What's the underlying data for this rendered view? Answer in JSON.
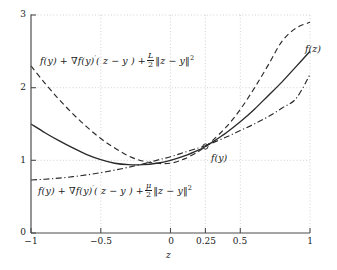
{
  "chart_data": {
    "type": "line",
    "title": "",
    "xlabel": "z",
    "ylabel": "",
    "xlim": [
      -1,
      1
    ],
    "ylim": [
      0,
      3
    ],
    "grid": true,
    "grid_style": "dotted",
    "legend": "none",
    "xticks": [
      -1,
      -0.5,
      0,
      0.25,
      0.5,
      1
    ],
    "xtick_labels": [
      "-1",
      "-0.5",
      "0",
      "0.25",
      "0.5",
      "1"
    ],
    "yticks": [
      0,
      1,
      2,
      3
    ],
    "ytick_labels": [
      "0",
      "1",
      "2",
      "3"
    ],
    "tangent_point": {
      "x": 0.25,
      "y": 1.19,
      "marker": "circle"
    },
    "series": [
      {
        "name": "f(z)",
        "style": "solid",
        "color": "#2a2a2a",
        "x": [
          -1,
          -0.9,
          -0.8,
          -0.7,
          -0.6,
          -0.5,
          -0.4,
          -0.3,
          -0.2,
          -0.1,
          0,
          0.1,
          0.2,
          0.25,
          0.3,
          0.4,
          0.5,
          0.6,
          0.7,
          0.8,
          0.9,
          1
        ],
        "values": [
          1.5,
          1.38,
          1.27,
          1.17,
          1.08,
          1.01,
          0.96,
          0.94,
          0.94,
          0.96,
          1.0,
          1.06,
          1.14,
          1.19,
          1.25,
          1.38,
          1.53,
          1.7,
          1.89,
          2.08,
          2.29,
          2.5
        ]
      },
      {
        "name": "f(y) + grad f(y)'(z-y) + (L/2)||z-y||^2",
        "style": "dashed",
        "color": "#2a2a2a",
        "x": [
          -1,
          -0.9,
          -0.8,
          -0.7,
          -0.6,
          -0.5,
          -0.4,
          -0.3,
          -0.2,
          -0.1,
          0,
          0.1,
          0.2,
          0.25,
          0.3,
          0.4,
          0.5,
          0.6,
          0.7,
          0.8,
          0.9,
          1
        ],
        "values": [
          2.3,
          2.06,
          1.84,
          1.64,
          1.46,
          1.3,
          1.17,
          1.06,
          0.99,
          0.96,
          0.96,
          1.02,
          1.12,
          1.19,
          1.27,
          1.46,
          1.7,
          1.99,
          2.31,
          2.64,
          2.82,
          2.9
        ]
      },
      {
        "name": "f(y) + grad f(y)'(z-y) + (mu/2)||z-y||^2",
        "style": "dashdot",
        "color": "#2a2a2a",
        "x": [
          -1,
          -0.9,
          -0.8,
          -0.7,
          -0.6,
          -0.5,
          -0.4,
          -0.3,
          -0.2,
          -0.1,
          0,
          0.1,
          0.2,
          0.25,
          0.3,
          0.4,
          0.5,
          0.6,
          0.7,
          0.8,
          0.9,
          1
        ],
        "values": [
          0.73,
          0.74,
          0.755,
          0.775,
          0.8,
          0.83,
          0.865,
          0.905,
          0.95,
          1.0,
          1.05,
          1.11,
          1.17,
          1.2,
          1.24,
          1.32,
          1.41,
          1.5,
          1.6,
          1.72,
          1.85,
          2.18
        ]
      }
    ],
    "annotations": [
      {
        "id": "upper-bound-label",
        "text": "f(y) + ∇f(y)'(z−y) + L/2 ‖z−y‖²",
        "x": 0.12,
        "y": 2.45
      },
      {
        "id": "lower-bound-label",
        "text": "f(y) + ∇f(y)'(z−y) + μ/2 ‖z−y‖²",
        "x": 0.12,
        "y": 0.56
      },
      {
        "id": "fz-label",
        "text": "f(z)",
        "x": 1.02,
        "y": 2.52
      },
      {
        "id": "fy-label",
        "text": "f(y)",
        "x": 0.32,
        "y": 1.02
      }
    ]
  },
  "axes": {
    "x_title": "z",
    "y_tick_0": "0",
    "y_tick_1": "1",
    "y_tick_2": "2",
    "y_tick_3": "3",
    "x_tick_m1": "−1",
    "x_tick_m05": "−0.5",
    "x_tick_0": "0",
    "x_tick_025": "0.25",
    "x_tick_05": "0.5",
    "x_tick_1": "1"
  },
  "labels": {
    "fz": "f(z)",
    "fy": "f(y)",
    "upper": {
      "lead": "f(y) + ∇f(y)",
      "prime": "′",
      "arg": "( z − y ) +",
      "num": "L",
      "den": "2",
      "norm": "‖z − y‖",
      "sup": "2"
    },
    "lower": {
      "lead": "f(y) + ∇f(y)",
      "prime": "′",
      "arg": "( z − y ) +",
      "num": "μ",
      "den": "2",
      "norm": "‖z − y‖",
      "sup": "2"
    }
  },
  "colors": {
    "ink": "#2a2a2a",
    "axis": "#555555",
    "grid": "#bbbbbb",
    "background": "#ffffff"
  }
}
